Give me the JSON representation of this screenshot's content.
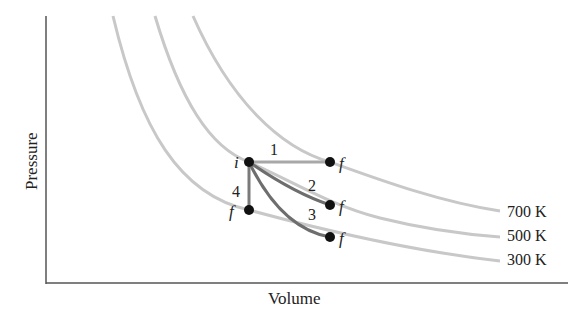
{
  "axes": {
    "x_label": "Volume",
    "y_label": "Pressure"
  },
  "isotherms": [
    {
      "label": "700 K",
      "color": "#c8c8c8"
    },
    {
      "label": "500 K",
      "color": "#c8c8c8"
    },
    {
      "label": "300 K",
      "color": "#c8c8c8"
    }
  ],
  "points": {
    "initial": "i",
    "final": "f"
  },
  "processes": [
    {
      "label": "1",
      "description": "isobaric expansion to 700 K",
      "color": "#9a9a9a"
    },
    {
      "label": "2",
      "description": "path to f on 500 K",
      "color": "#707070"
    },
    {
      "label": "3",
      "description": "path to f on 300 K",
      "color": "#707070"
    },
    {
      "label": "4",
      "description": "isochoric to 300 K",
      "color": "#7a7a7a"
    }
  ],
  "colors": {
    "axis": "#555555",
    "point": "#111111",
    "text": "#222222"
  }
}
